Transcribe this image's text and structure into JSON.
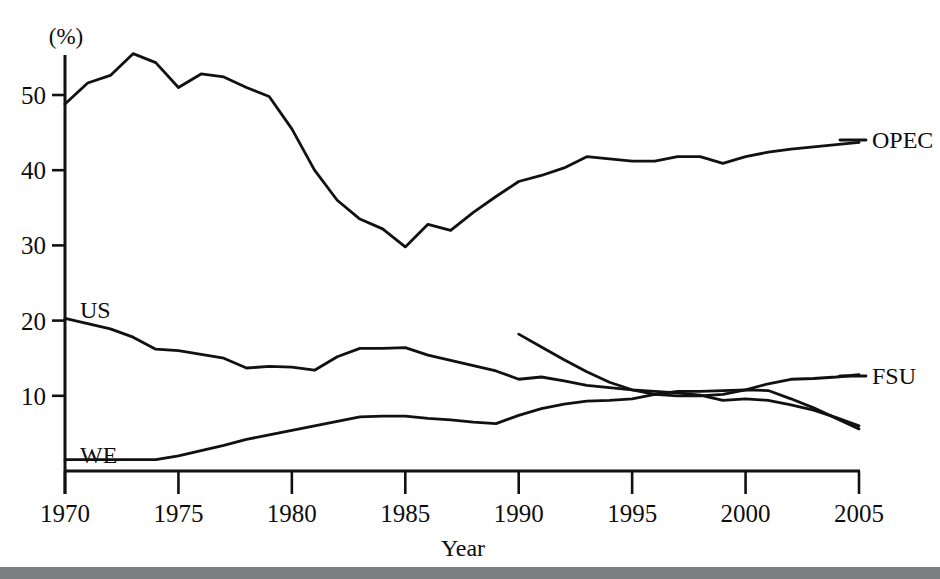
{
  "chart_data": {
    "type": "line",
    "title": "",
    "subtitle": "",
    "xlabel": "Year",
    "ylabel": "",
    "unit_label": "(%)",
    "xlim": [
      1970,
      2005
    ],
    "ylim": [
      0,
      57
    ],
    "grid": false,
    "legend_position": "right-inline-labels",
    "x_ticks": [
      "1970",
      "1975",
      "1980",
      "1985",
      "1990",
      "1995",
      "2000",
      "2005"
    ],
    "x_tick_values": [
      1970,
      1975,
      1980,
      1985,
      1990,
      1995,
      2000,
      2005
    ],
    "y_ticks": [
      "10",
      "20",
      "30",
      "40",
      "50"
    ],
    "y_tick_values": [
      10,
      20,
      30,
      40,
      50
    ],
    "series": [
      {
        "name": "OPEC",
        "label": "OPEC",
        "label_position": "right",
        "x": [
          1970,
          1971,
          1972,
          1973,
          1974,
          1975,
          1976,
          1977,
          1978,
          1979,
          1980,
          1981,
          1982,
          1983,
          1984,
          1985,
          1986,
          1987,
          1988,
          1989,
          1990,
          1991,
          1992,
          1993,
          1994,
          1995,
          1996,
          1997,
          1998,
          1999,
          2000,
          2001,
          2002,
          2003,
          2004,
          2005
        ],
        "values": [
          48.8,
          51.6,
          52.6,
          55.5,
          54.3,
          51.0,
          52.8,
          52.4,
          51.0,
          49.8,
          45.5,
          40.0,
          36.0,
          33.5,
          32.2,
          29.8,
          32.8,
          32.0,
          34.4,
          36.5,
          38.5,
          39.3,
          40.3,
          41.8,
          41.5,
          41.2,
          41.2,
          41.8,
          41.8,
          40.9,
          41.8,
          42.4,
          42.8,
          43.1,
          43.4,
          43.7
        ]
      },
      {
        "name": "US",
        "label": "US",
        "label_position": "left-inline",
        "x": [
          1970,
          1971,
          1972,
          1973,
          1974,
          1975,
          1976,
          1977,
          1978,
          1979,
          1980,
          1981,
          1982,
          1983,
          1984,
          1985,
          1986,
          1987,
          1988,
          1989,
          1990,
          1991,
          1992,
          1993,
          1994,
          1995,
          1996,
          1997,
          1998,
          1999,
          2000,
          2001,
          2002,
          2003,
          2004,
          2005
        ],
        "values": [
          20.3,
          19.6,
          18.9,
          17.8,
          16.2,
          16.0,
          15.5,
          15.0,
          13.7,
          13.9,
          13.8,
          13.4,
          15.2,
          16.3,
          16.3,
          16.4,
          15.4,
          14.7,
          14.0,
          13.3,
          12.2,
          12.5,
          12.0,
          11.4,
          11.1,
          10.8,
          10.6,
          10.4,
          10.1,
          9.4,
          9.6,
          9.4,
          8.8,
          8.1,
          7.1,
          6.0
        ]
      },
      {
        "name": "WE",
        "label": "WE",
        "label_position": "left-inline",
        "x": [
          1970,
          1971,
          1972,
          1973,
          1974,
          1975,
          1976,
          1977,
          1978,
          1979,
          1980,
          1981,
          1982,
          1983,
          1984,
          1985,
          1986,
          1987,
          1988,
          1989,
          1990,
          1991,
          1992,
          1993,
          1994,
          1995,
          1996,
          1997,
          1998,
          1999,
          2000,
          2001,
          2002,
          2003,
          2004,
          2005
        ],
        "values": [
          1.5,
          1.5,
          1.5,
          1.5,
          1.5,
          2.0,
          2.7,
          3.4,
          4.2,
          4.8,
          5.4,
          6.0,
          6.6,
          7.2,
          7.3,
          7.3,
          7.0,
          6.8,
          6.5,
          6.3,
          7.4,
          8.3,
          8.9,
          9.3,
          9.4,
          9.6,
          10.2,
          10.6,
          10.6,
          10.7,
          10.8,
          10.7,
          9.6,
          8.4,
          7.0,
          5.6
        ]
      },
      {
        "name": "FSU",
        "label": "FSU",
        "label_position": "right",
        "x": [
          1990,
          1991,
          1992,
          1993,
          1994,
          1995,
          1996,
          1997,
          1998,
          1999,
          2000,
          2001,
          2002,
          2003,
          2004,
          2005
        ],
        "values": [
          18.2,
          16.5,
          14.8,
          13.2,
          11.8,
          10.8,
          10.2,
          10.0,
          10.0,
          10.2,
          10.8,
          11.6,
          12.2,
          12.3,
          12.5,
          12.8
        ]
      }
    ]
  },
  "axis": {
    "unit": "(%)",
    "x_title": "Year"
  },
  "labels": {
    "opec": "OPEC",
    "us": "US",
    "we": "WE",
    "fsu": "FSU"
  },
  "colors": {
    "ink": "#111111",
    "background": "#ffffff",
    "bottom_strip": "#7d7f80"
  }
}
